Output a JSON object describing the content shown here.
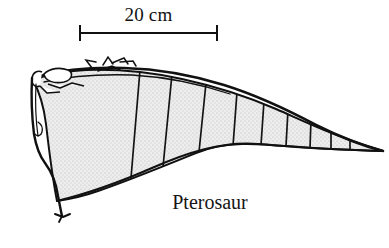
{
  "figure": {
    "kind": "scientific-line-drawing",
    "subject_caption": "Pterosaur",
    "background_color": "#ffffff",
    "ink_color": "#111111",
    "membrane_fill_color": "#e6e6e6",
    "membrane_stipple_color": "#b8b8b8"
  },
  "scale_bar": {
    "label": "20 cm",
    "value": 20,
    "unit": "cm",
    "bar_left_x": 79,
    "bar_right_x": 218,
    "bar_y": 33,
    "tick_height": 16,
    "line_color": "#111111"
  },
  "caption": {
    "text": "Pterosaur",
    "x": 210,
    "y": 205
  },
  "wing": {
    "name": "pterosaur-wing-membrane",
    "tip_point": {
      "x": 383,
      "y": 151
    },
    "shoulder_point": {
      "x": 33,
      "y": 80
    },
    "rib_count": 9,
    "rib_label": "wing membrane support rib",
    "outline_stroke_width": 2.0,
    "rib_stroke_width": 1.6
  },
  "annotations": {
    "scale_bar_name": "scale-bar",
    "wing_name": "wing-outline",
    "caption_name": "figure-caption"
  }
}
